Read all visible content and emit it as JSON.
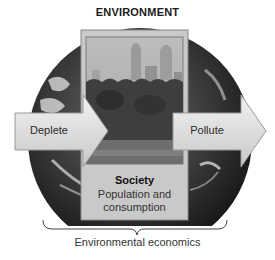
{
  "diagram": {
    "title": "ENVIRONMENT",
    "left_arrow": {
      "label": "Deplete"
    },
    "right_arrow": {
      "label": "Pollute"
    },
    "center_box": {
      "title": "Society",
      "subtitle": "Population and consumption"
    },
    "caption": "Environmental economics",
    "colors": {
      "globe_dark": "#1c1c1c",
      "panel_fill": "#c9c9c9",
      "panel_border": "#8a8a8a",
      "arrow_fill": "#d8d8d8",
      "arrow_border": "#9a9a9a"
    }
  }
}
